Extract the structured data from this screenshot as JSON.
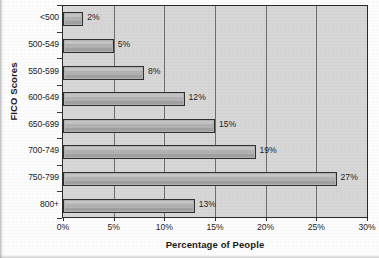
{
  "chart_data": {
    "type": "bar",
    "orientation": "horizontal",
    "title": "FICO Scores",
    "xlabel": "Percentage of People",
    "ylabel": "FICO Scores",
    "categories": [
      "<500",
      "500-549",
      "550-599",
      "600-649",
      "650-699",
      "700-749",
      "750-799",
      "800+"
    ],
    "values": [
      2,
      5,
      8,
      12,
      15,
      19,
      27,
      13
    ],
    "data_labels": [
      "2%",
      "5%",
      "8%",
      "12%",
      "15%",
      "19%",
      "27%",
      "13%"
    ],
    "xlim": [
      0,
      30
    ],
    "xticks": [
      0,
      5,
      10,
      15,
      20,
      25,
      30
    ],
    "xtick_labels": [
      "0%",
      "5%",
      "10%",
      "15%",
      "20%",
      "25%",
      "30%"
    ],
    "grid": "vertical",
    "legend": null,
    "plot_background_color": "#d7d7d7",
    "bar_fill_color": "#b2b2b2",
    "bar_border_color": "#303030",
    "gridline_color": "#6e6e6e",
    "axis_color": "#2b2b2b",
    "text_color": "#1d1d1d"
  }
}
